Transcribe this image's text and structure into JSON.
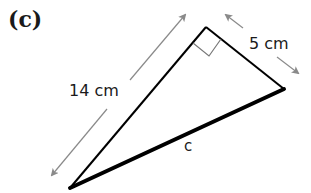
{
  "diagram": {
    "part_label": "(c)",
    "triangle": {
      "type": "right triangle",
      "vertices": {
        "bottom_left": [
          70,
          188
        ],
        "right_angle": [
          206,
          27
        ],
        "right": [
          284,
          89
        ]
      },
      "sides": [
        {
          "name": "hypotenuse",
          "label": "c",
          "emphasized": true
        },
        {
          "name": "long_leg",
          "label": "14 cm"
        },
        {
          "name": "short_leg",
          "label": "5 cm"
        }
      ],
      "right_angle_marker": true
    },
    "labels": {
      "long_leg": "14 cm",
      "short_leg": "5 cm",
      "hypotenuse": "c"
    },
    "colors": {
      "line": "#000000",
      "arrow": "#8a8a8a",
      "marker": "#777777"
    }
  }
}
